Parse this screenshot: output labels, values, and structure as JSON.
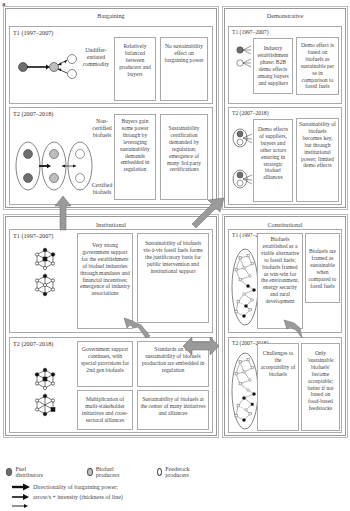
{
  "figure_letter": "a",
  "quadrants": {
    "bargaining": {
      "title": "Bargaining",
      "t1": {
        "label": "T1 (1997–2007)",
        "side_label": "Undiffer-\nentiated\ncommodity",
        "boxes": [
          "Relatively balanced between producers and buyers",
          "No sustainability effect on bargaining power"
        ]
      },
      "t2": {
        "label": "T2 (2007–2018)",
        "side_label_top": "Non-\ncertified\nbiofuels",
        "side_label_bottom": "Certified\nbiofuels",
        "boxes": [
          "Buyers gain some power through by leveraging sustainability demands embedded in regulation",
          "Sustainability certification demanded by regulation; emergence of many 3rd party certifications"
        ]
      }
    },
    "demonstrative": {
      "title": "Demonstrative",
      "t1": {
        "label": "T1 (1997–2007)",
        "boxes": [
          "Industry establishment phase: B2B demo effects among buyers and suppliers",
          "Demo effect is based on biofuels as sustainable per se in comparison to fossil fuels"
        ]
      },
      "t2": {
        "label": "T2 (2007–2018)",
        "boxes": [
          "Demo effects of suppliers, buyers and other actors entering in strategic biofuel alliances",
          "Sustainability of biofuels becomes key, but through institutional power; limited demo effects"
        ]
      }
    },
    "institutional": {
      "title": "Institutional",
      "t1": {
        "label": "T1 (1997–2007)",
        "boxes": [
          "Very strong government support for the establishment of biofuel industries through mandates and financial incentives; emergence of industry associations",
          "Sustainability of biofuels vis-à-vis fossil fuels forms the justificatory basis for public intervention and institutional support"
        ]
      },
      "t2": {
        "label": "T2 (2007–2018)",
        "boxes": [
          "Government support continues, with special provisions for 2nd gen biofuels",
          "Standards on the sustainability of biofuels production are embedded in regulation",
          "Multiplication of multi-stakeholder initiatives and cross-sectoral alliances",
          "Sustainability of biofuels at the center of many initiatives and alliances"
        ]
      }
    },
    "constitutional": {
      "title": "Constitutional",
      "t1": {
        "label": "T1 (1997–2007)",
        "boxes": [
          "Biofuels established as a viable alternative to fossil fuels; biofuels framed as win-win for the environment, energy security and rural development",
          "Biofuels are framed as sustainable when compared to fossil fuels"
        ]
      },
      "t2": {
        "label": "T2 (2007–2018)",
        "boxes": [
          "Challenges to the acceptability of biofuels",
          "Only 'sustainable biofuels' become acceptable; better if not based on food-based feedstocks"
        ]
      }
    }
  },
  "legend": {
    "items": [
      {
        "label": "Fuel distributors",
        "color": "#777777"
      },
      {
        "label": "Biofuel producers",
        "color": "#bbbbbb"
      },
      {
        "label": "Feedstock producers",
        "color": "#ffffff"
      }
    ],
    "arrow_lines": [
      "Directionality of bargaining power:",
      "arrow/s + intensity (thickness of line)"
    ]
  },
  "colors": {
    "fuel_distributor": "#6e6e6e",
    "biofuel_producer": "#bdbdbd",
    "feedstock_producer": "#ffffff",
    "big_arrow": "#9a9a9a"
  }
}
